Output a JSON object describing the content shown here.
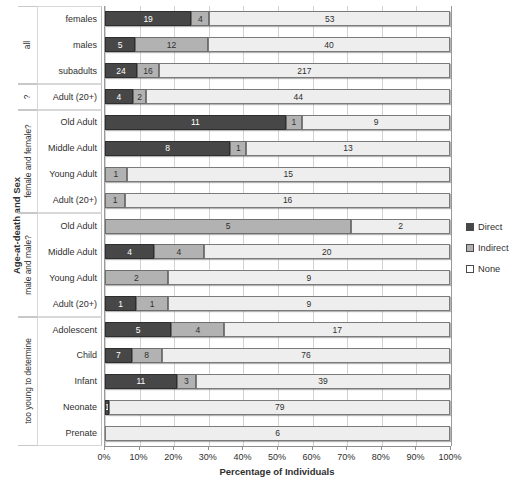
{
  "chart_data": {
    "type": "bar",
    "orientation": "horizontal",
    "stacked": true,
    "normalized": true,
    "title": "",
    "xlabel": "Percentage of Individuals",
    "ylabel": "Age-at-death and Sex",
    "xlim": [
      0,
      100
    ],
    "xticks": [
      "0%",
      "10%",
      "20%",
      "30%",
      "40%",
      "50%",
      "60%",
      "70%",
      "80%",
      "90%",
      "100%"
    ],
    "grid": true,
    "legend_position": "right",
    "legend": [
      "Direct",
      "Indirect",
      "None"
    ],
    "series": [
      {
        "name": "Direct",
        "color": "#474747"
      },
      {
        "name": "Indirect",
        "color": "#b2b2b2"
      },
      {
        "name": "None",
        "color": "#eeeeee"
      }
    ],
    "groups": [
      {
        "label": "all",
        "rows": [
          {
            "category": "females",
            "values": {
              "Direct": 19,
              "Indirect": 4,
              "None": 53
            }
          },
          {
            "category": "males",
            "values": {
              "Direct": 5,
              "Indirect": 12,
              "None": 40
            }
          },
          {
            "category": "subadults",
            "values": {
              "Direct": 24,
              "Indirect": 16,
              "None": 217
            }
          }
        ]
      },
      {
        "label": "?",
        "rows": [
          {
            "category": "Adult (20+)",
            "values": {
              "Direct": 4,
              "Indirect": 2,
              "None": 44
            }
          }
        ]
      },
      {
        "label": "female and female?",
        "rows": [
          {
            "category": "Old Adult",
            "values": {
              "Direct": 11,
              "Indirect": 1,
              "None": 9
            }
          },
          {
            "category": "Middle Adult",
            "values": {
              "Direct": 8,
              "Indirect": 1,
              "None": 13
            }
          },
          {
            "category": "Young Adult",
            "values": {
              "Direct": 0,
              "Indirect": 1,
              "None": 15
            }
          },
          {
            "category": "Adult (20+)",
            "values": {
              "Direct": 0,
              "Indirect": 1,
              "None": 16
            }
          }
        ]
      },
      {
        "label": "male and male?",
        "rows": [
          {
            "category": "Old Adult",
            "values": {
              "Direct": 0,
              "Indirect": 5,
              "None": 2
            }
          },
          {
            "category": "Middle Adult",
            "values": {
              "Direct": 4,
              "Indirect": 4,
              "None": 20
            }
          },
          {
            "category": "Young Adult",
            "values": {
              "Direct": 0,
              "Indirect": 2,
              "None": 9
            }
          },
          {
            "category": "Adult (20+)",
            "values": {
              "Direct": 1,
              "Indirect": 1,
              "None": 9
            }
          }
        ]
      },
      {
        "label": "too young to determine",
        "rows": [
          {
            "category": "Adolescent",
            "values": {
              "Direct": 5,
              "Indirect": 4,
              "None": 17
            }
          },
          {
            "category": "Child",
            "values": {
              "Direct": 7,
              "Indirect": 8,
              "None": 76
            }
          },
          {
            "category": "Infant",
            "values": {
              "Direct": 11,
              "Indirect": 3,
              "None": 39
            }
          },
          {
            "category": "Neonate",
            "values": {
              "Direct": 1,
              "Indirect": 0,
              "None": 79
            }
          },
          {
            "category": "Prenate",
            "values": {
              "Direct": 0,
              "Indirect": 0,
              "None": 6
            }
          }
        ]
      }
    ]
  }
}
